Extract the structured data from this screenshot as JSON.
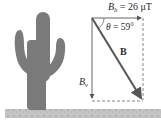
{
  "diagram": {
    "labels": {
      "bh_symbol": "B",
      "bh_sub": "h",
      "bh_value": " = 26 μT",
      "theta_symbol": "θ",
      "theta_value": " = 59°",
      "b_vector": "B",
      "bv_symbol": "B",
      "bv_sub": "v"
    },
    "colors": {
      "cactus": "#7a7a7a",
      "ground": "#bdbdbd",
      "vector": "#555555",
      "dashed": "#666666",
      "text": "#2a2a2a"
    }
  }
}
